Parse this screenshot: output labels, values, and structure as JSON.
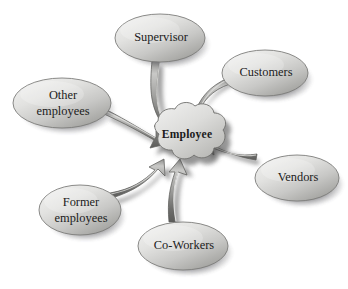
{
  "diagram": {
    "type": "hub-and-spoke relationship diagram",
    "title": "Employee",
    "center": {
      "label": "Employee",
      "shape": "cloud",
      "cx": 186,
      "cy": 141,
      "name": "center-node-employee"
    },
    "nodes": [
      {
        "id": "supervisor",
        "label": "Supervisor",
        "lines": [
          "Supervisor"
        ],
        "cx": 160,
        "cy": 38,
        "rx": 45,
        "ry": 24,
        "arrow_from": "supervisor",
        "arrow_to": "employee"
      },
      {
        "id": "customers",
        "label": "Customers",
        "lines": [
          "Customers"
        ],
        "cx": 265,
        "cy": 73,
        "rx": 43,
        "ry": 23,
        "arrow_from": "customers",
        "arrow_to": "employee"
      },
      {
        "id": "vendors",
        "label": "Vendors",
        "lines": [
          "Vendors"
        ],
        "cx": 297,
        "cy": 178,
        "rx": 42,
        "ry": 23,
        "arrow_from": "vendors",
        "arrow_to": "employee"
      },
      {
        "id": "co-workers",
        "label": "Co-Workers",
        "lines": [
          "Co-Workers"
        ],
        "cx": 183,
        "cy": 246,
        "rx": 45,
        "ry": 24,
        "arrow_from": "co-workers",
        "arrow_to": "employee"
      },
      {
        "id": "former-employees",
        "label": "Former employees",
        "lines": [
          "Former",
          "employees"
        ],
        "cx": 80,
        "cy": 210,
        "rx": 41,
        "ry": 25,
        "arrow_from": "former-employees",
        "arrow_to": "employee"
      },
      {
        "id": "other-employees",
        "label": "Other employees",
        "lines": [
          "Other",
          "employees"
        ],
        "cx": 62,
        "cy": 103,
        "rx": 49,
        "ry": 25,
        "arrow_from": "other-employees",
        "arrow_to": "employee"
      }
    ],
    "colors": {
      "background": "#ffffff",
      "node_fill_light": "#ededec",
      "node_fill_mid": "#cfcfcd",
      "node_fill_dark": "#a2a2a0",
      "node_edge": "#7d7d7b",
      "shadow": "#4a4a48",
      "arrow_light": "#cdcdcb",
      "arrow_dark": "#6e6e6c",
      "text": "#1b1b1b"
    }
  }
}
